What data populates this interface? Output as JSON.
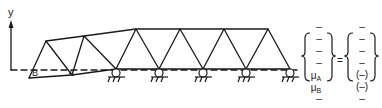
{
  "diagram": {
    "axis_label": "y",
    "node_labels": {
      "B": "B",
      "A": "A"
    },
    "lhs_vector": [
      "–",
      "–",
      "–",
      "–",
      "μ",
      "μ",
      "–"
    ],
    "lhs_subscripts": [
      "",
      "",
      "",
      "",
      "A",
      "B",
      ""
    ],
    "equals": "=",
    "rhs_vector": [
      "–",
      "–",
      "–",
      "–",
      "(–)",
      "(–)",
      "–"
    ],
    "line_color": "#1a1a1a",
    "supports_count": 5
  }
}
